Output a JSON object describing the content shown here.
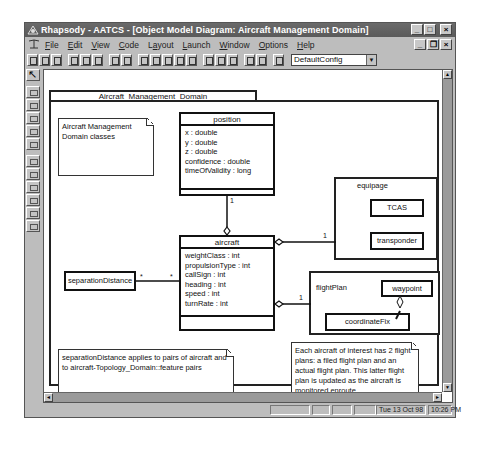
{
  "window": {
    "title": "Rhapsody - AATCS - [Object Model Diagram: Aircraft Management Domain]",
    "controls": {
      "minimize": "_",
      "maximize": "□",
      "close": "×"
    },
    "mdi_controls": {
      "minimize": "_",
      "restore": "❐",
      "close": "×"
    }
  },
  "menubar": {
    "items": [
      {
        "label": "File",
        "accel": "F"
      },
      {
        "label": "Edit",
        "accel": "E"
      },
      {
        "label": "View",
        "accel": "V"
      },
      {
        "label": "Code",
        "accel": "C"
      },
      {
        "label": "Layout",
        "accel": "a"
      },
      {
        "label": "Launch",
        "accel": "L"
      },
      {
        "label": "Window",
        "accel": "W"
      },
      {
        "label": "Options",
        "accel": "O"
      },
      {
        "label": "Help",
        "accel": "H"
      }
    ]
  },
  "toolbar": {
    "buttons": [
      "new-icon",
      "open-icon",
      "save-icon",
      "cut-icon",
      "copy-icon",
      "paste-icon",
      "print-icon",
      "help-icon",
      "zoom-in-icon",
      "zoom-out-icon",
      "zoom-fit-icon",
      "zoom-region-icon",
      "undo-zoom-icon",
      "browser-icon",
      "diagram-icon",
      "doc-icon",
      "delete-icon",
      "generate-icon",
      "make-icon"
    ],
    "config_select": {
      "value": "DefaultConfig",
      "arrow": "▼"
    }
  },
  "palette": {
    "tools": [
      "select-arrow",
      "package",
      "class",
      "object",
      "note",
      "composite",
      "association",
      "directed-association",
      "aggregation",
      "dependency",
      "inheritance",
      "anchor"
    ]
  },
  "diagram": {
    "package_name": "Aircraft_Management_Domain",
    "notes": {
      "domain": "Aircraft Management Domain classes",
      "separation": "separationDistance applies to pairs of aircraft and to aircraft-Topology_Domain::feature pairs",
      "flightplan": "Each aircraft of interest has 2 flight plans: a filed flight plan and an actual flight plan. This latter flight plan is updated as the aircraft is monitored enroute."
    },
    "classes": {
      "position": {
        "name": "position",
        "attributes": [
          "x : double",
          "y : double",
          "z : double",
          "confidence : double",
          "timeOfValidity : long"
        ]
      },
      "aircraft": {
        "name": "aircraft",
        "attributes": [
          "weightClass : int",
          "propulsionType : int",
          "callSign : int",
          "heading : int",
          "speed : int",
          "turnRate : int"
        ]
      },
      "separationDistance": {
        "name": "separationDistance"
      }
    },
    "composites": {
      "equipage": {
        "name": "equipage",
        "parts": [
          "TCAS",
          "transponder"
        ]
      },
      "flightPlan": {
        "name": "flightPlan",
        "parts": [
          "waypoint",
          "coordinateFix"
        ]
      }
    },
    "multiplicities": {
      "position_aircraft": "1",
      "aircraft_equipage": "1",
      "aircraft_flightplan": "1",
      "sep_left": "*",
      "sep_right": "*",
      "waypoint_fix": "1"
    }
  },
  "statusbar": {
    "date": "Tue 13 Oct 98",
    "time": "10:26 PM"
  },
  "scrollbars": {
    "up": "▲",
    "down": "▼",
    "left": "◄",
    "right": "►"
  }
}
